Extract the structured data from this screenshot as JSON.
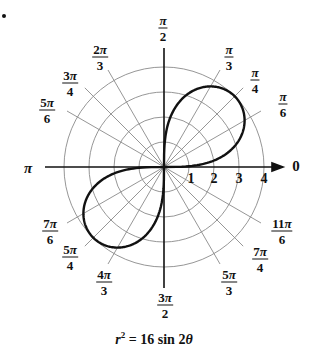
{
  "bullet": "•",
  "angle_labels": [
    {
      "id": "0",
      "plain": "0",
      "x": 296,
      "y": 166
    },
    {
      "id": "pi_6",
      "num": "π",
      "den": "6",
      "x": 283,
      "y": 104
    },
    {
      "id": "pi_4",
      "num": "π",
      "den": "4",
      "x": 255,
      "y": 80
    },
    {
      "id": "pi_3",
      "num": "π",
      "den": "3",
      "x": 229,
      "y": 57
    },
    {
      "id": "pi_2",
      "num": "π",
      "den": "2",
      "x": 163,
      "y": 28
    },
    {
      "id": "2pi_3",
      "num": "2π",
      "den": "3",
      "x": 100,
      "y": 57
    },
    {
      "id": "3pi_4",
      "num": "3π",
      "den": "4",
      "x": 70,
      "y": 83
    },
    {
      "id": "5pi_6",
      "num": "5π",
      "den": "6",
      "x": 47,
      "y": 110
    },
    {
      "id": "pi",
      "plain": "π",
      "x": 28,
      "y": 168
    },
    {
      "id": "7pi_6",
      "num": "7π",
      "den": "6",
      "x": 50,
      "y": 231
    },
    {
      "id": "5pi_4",
      "num": "5π",
      "den": "4",
      "x": 70,
      "y": 257
    },
    {
      "id": "4pi_3",
      "num": "4π",
      "den": "3",
      "x": 104,
      "y": 282
    },
    {
      "id": "3pi_2",
      "num": "3π",
      "den": "2",
      "x": 165,
      "y": 305
    },
    {
      "id": "5pi_3",
      "num": "5π",
      "den": "3",
      "x": 229,
      "y": 282
    },
    {
      "id": "7pi_4",
      "num": "7π",
      "den": "4",
      "x": 260,
      "y": 259
    },
    {
      "id": "11pi_6",
      "num": "11π",
      "den": "6",
      "x": 282,
      "y": 231
    }
  ],
  "radial_ticks": [
    "1",
    "2",
    "3",
    "4"
  ],
  "caption": {
    "lhs": "r",
    "exp": "2",
    "rhs": " = 16 sin 2",
    "theta": "θ"
  },
  "chart_data": {
    "type": "polar-line",
    "equation": "r^2 = 16 sin(2θ)",
    "curve": "lemniscate",
    "r_max": 4,
    "r_gridlines": [
      1,
      2,
      3,
      4
    ],
    "angle_gridlines": [
      "0",
      "π/6",
      "π/4",
      "π/3",
      "π/2",
      "2π/3",
      "3π/4",
      "5π/6",
      "π",
      "7π/6",
      "5π/4",
      "4π/3",
      "3π/2",
      "5π/3",
      "7π/4",
      "11π/6"
    ],
    "loops": [
      {
        "quadrant": "I",
        "theta_range": [
          0,
          1.5708
        ],
        "max_r": 4,
        "max_at": "π/4"
      },
      {
        "quadrant": "III",
        "theta_range": [
          3.1416,
          4.7124
        ],
        "max_r": 4,
        "max_at": "5π/4"
      }
    ],
    "grid": true
  }
}
